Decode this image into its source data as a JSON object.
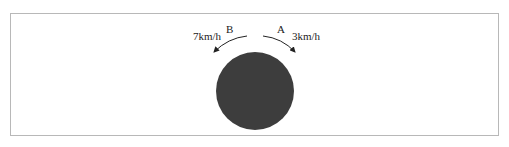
{
  "diagram": {
    "labels": {
      "left_point": "B",
      "right_point": "A",
      "left_speed": "7km/h",
      "right_speed": "3km/h"
    },
    "colors": {
      "circle": "#3d3d3d",
      "arrow": "#222222",
      "frame": "#b8b8b8"
    }
  }
}
